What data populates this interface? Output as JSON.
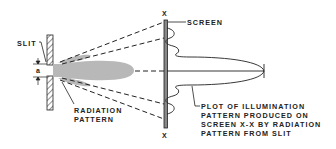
{
  "diagram": {
    "labels": {
      "slit": "SLIT",
      "a": "a",
      "radiation_pattern_line1": "RADIATION",
      "radiation_pattern_line2": "PATTERN",
      "screen": "SCREEN",
      "x_top": "X",
      "x_bottom": "X",
      "plot_line1": "PLOT OF ILLUMINATION",
      "plot_line2": "PATTERN PRODUCED ON",
      "plot_line3": "SCREEN X-X BY RADIATION",
      "plot_line4": "PATTERN FROM SLIT"
    },
    "colors": {
      "line": "#222222",
      "pattern_fill": "#b8b8b8",
      "screen_fill": "#888888",
      "background": "#ffffff"
    }
  }
}
